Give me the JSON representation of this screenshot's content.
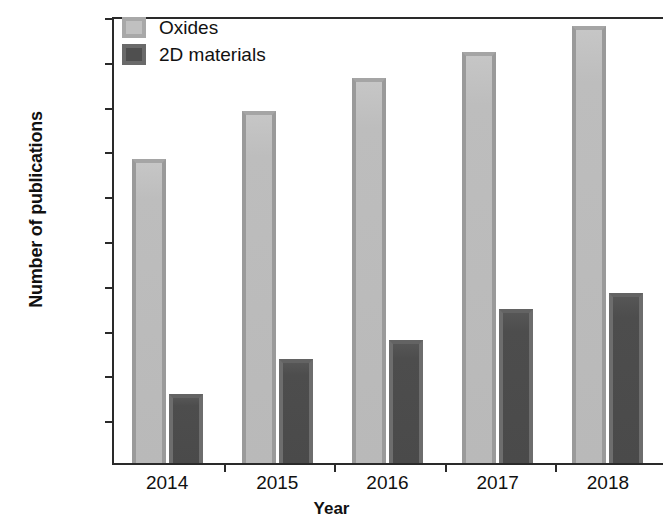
{
  "chart_data": {
    "type": "bar",
    "title": "",
    "xlabel": "Year",
    "ylabel": "Number of publications",
    "categories": [
      "2014",
      "2015",
      "2016",
      "2017",
      "2018"
    ],
    "series": [
      {
        "name": "Oxides",
        "color": "#b4b4b4",
        "values": [
          6780,
          7850,
          8600,
          9170,
          9750
        ]
      },
      {
        "name": "2D materials",
        "color": "#4f4f4f",
        "values": [
          1550,
          2320,
          2750,
          3440,
          3800
        ]
      }
    ],
    "ylim": [
      0,
      10000
    ],
    "ytick_labels": [
      "1,000",
      "2,000",
      "3,000",
      "4,000",
      "5,000",
      "6,000",
      "7,000",
      "8,000",
      "9,000",
      "10,000"
    ],
    "ytick_values": [
      1000,
      2000,
      3000,
      4000,
      5000,
      6000,
      7000,
      8000,
      9000,
      10000
    ],
    "grid": false,
    "legend_position": "top-left"
  },
  "legend": {
    "items": [
      {
        "label": "Oxides",
        "style": "light"
      },
      {
        "label": "2D materials",
        "style": "dark"
      }
    ]
  },
  "axes": {
    "y_title": "Number of publications",
    "x_title": "Year"
  }
}
